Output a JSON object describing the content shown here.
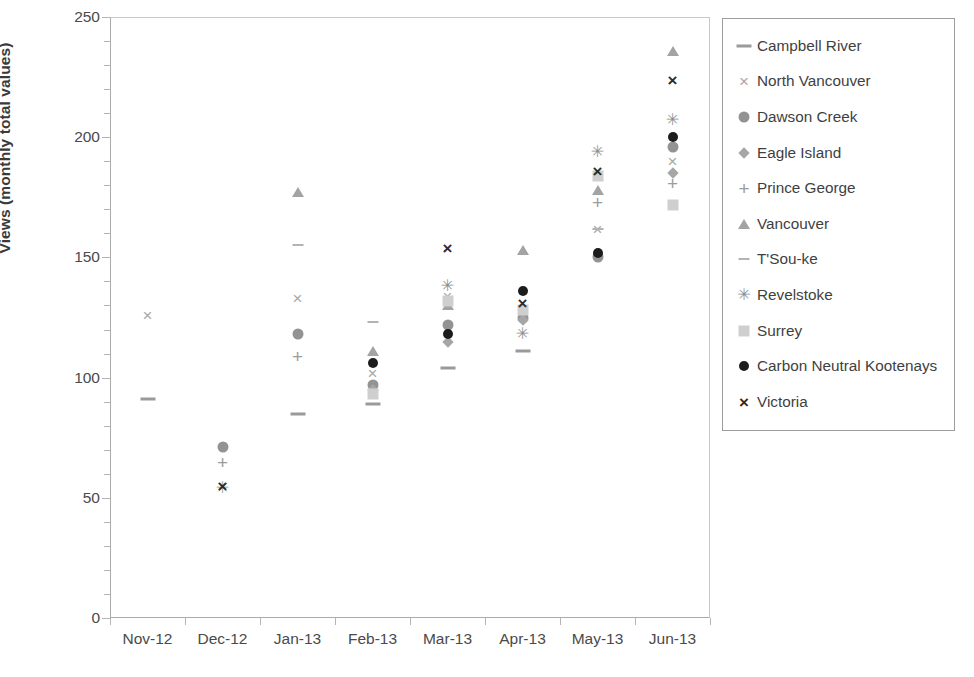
{
  "chart_data": {
    "type": "scatter",
    "title": "",
    "xlabel": "",
    "ylabel": "Views (monthly total values)",
    "categories": [
      "Nov-12",
      "Dec-12",
      "Jan-13",
      "Feb-13",
      "Mar-13",
      "Apr-13",
      "May-13",
      "Jun-13"
    ],
    "ylim": [
      0,
      250
    ],
    "ytick_labels": [
      "0",
      "50",
      "100",
      "150",
      "200",
      "250"
    ],
    "ytick_values": [
      0,
      50,
      100,
      150,
      200,
      250
    ],
    "ytick_minor_step": 10,
    "grid": false,
    "legend_position": "right",
    "series": [
      {
        "name": "Campbell River",
        "marker": "dash",
        "color": "#9a9a9a",
        "values": [
          91,
          null,
          85,
          89,
          104,
          111,
          null,
          null
        ]
      },
      {
        "name": "North Vancouver",
        "marker": "x",
        "color": "#a8a8a8",
        "values": [
          126,
          null,
          133,
          102,
          134,
          126,
          162,
          190
        ]
      },
      {
        "name": "Dawson Creek",
        "marker": "circle",
        "color": "#939393",
        "values": [
          null,
          71,
          118,
          97,
          122,
          125,
          150,
          196
        ]
      },
      {
        "name": "Eagle Island",
        "marker": "diamond",
        "color": "#a6a6a6",
        "values": [
          null,
          null,
          null,
          95,
          115,
          124,
          null,
          185
        ]
      },
      {
        "name": "Prince George",
        "marker": "plus",
        "color": "#9d9d9d",
        "values": [
          null,
          65,
          109,
          null,
          null,
          null,
          173,
          181
        ]
      },
      {
        "name": "Vancouver",
        "marker": "triangle",
        "color": "#a3a3a3",
        "values": [
          null,
          null,
          177,
          111,
          130,
          153,
          178,
          236
        ]
      },
      {
        "name": "T'Sou-ke",
        "marker": "dash-small",
        "color": "#b3b3b3",
        "values": [
          null,
          null,
          155,
          123,
          null,
          null,
          162,
          null
        ]
      },
      {
        "name": "Revelstoke",
        "marker": "star",
        "color": "#8d8d8d",
        "values": [
          null,
          54,
          null,
          null,
          138,
          118,
          194,
          207
        ]
      },
      {
        "name": "Surrey",
        "marker": "square",
        "color": "#cfcfcf",
        "values": [
          null,
          null,
          null,
          93,
          132,
          128,
          184,
          172
        ]
      },
      {
        "name": "Carbon Neutral Kootenays",
        "marker": "dot",
        "color": "#1c1c1c",
        "values": [
          null,
          null,
          null,
          106,
          118,
          136,
          152,
          200
        ]
      },
      {
        "name": "Victoria",
        "marker": "x-bold",
        "color": "#2b2b2b",
        "values": [
          null,
          55,
          null,
          null,
          154,
          131,
          186,
          224
        ]
      }
    ]
  }
}
